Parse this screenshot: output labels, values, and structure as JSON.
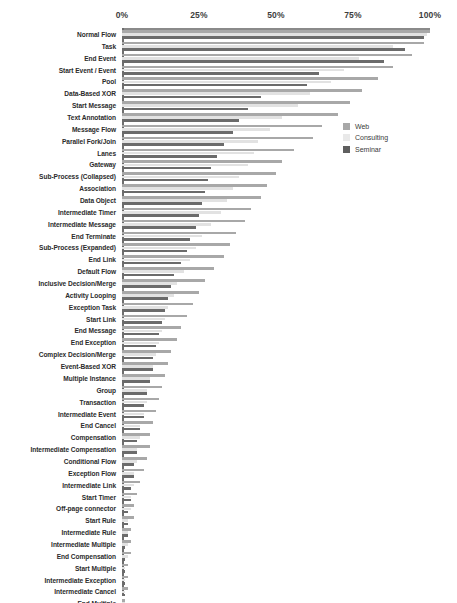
{
  "chart_data": {
    "type": "bar",
    "orientation": "horizontal",
    "title": "",
    "xlabel": "",
    "ylabel": "",
    "xlim": [
      0,
      100
    ],
    "xticks": [
      0,
      25,
      50,
      75,
      100
    ],
    "xtick_labels": [
      "0%",
      "25%",
      "50%",
      "75%",
      "100%"
    ],
    "grid": false,
    "legend_position": "center-right",
    "legend": [
      "Web",
      "Consulting",
      "Seminar"
    ],
    "series_colors": {
      "Web": "#a8a8a8",
      "Consulting": "#e2e2e2",
      "Seminar": "#6b6b6b"
    },
    "categories": [
      "Normal Flow",
      "Task",
      "End Event",
      "Start Event / Event",
      "Pool",
      "Data-Based XOR",
      "Start Message",
      "Text Annotation",
      "Message Flow",
      "Parallel Fork/Join",
      "Lanes",
      "Gateway",
      "Sub-Process (Collapsed)",
      "Association",
      "Data Object",
      "Intermediate Timer",
      "Intermediate Message",
      "End Terminate",
      "Sub-Process (Expanded)",
      "End Link",
      "Default Flow",
      "Inclusive Decision/Merge",
      "Activity Looping",
      "Exception Task",
      "Start Link",
      "End Message",
      "End Exception",
      "Complex Decision/Merge",
      "Event-Based XOR",
      "Multiple Instance",
      "Group",
      "Transaction",
      "Intermediate Event",
      "End Cancel",
      "Compensation",
      "Intermediate Compensation",
      "Conditional Flow",
      "Exception Flow",
      "Intermediate Link",
      "Start Timer",
      "Off-page connector",
      "Start Rule",
      "Intermediate Rule",
      "Intermediate Multiple",
      "End Compensation",
      "Start Multiple",
      "Intermediate Exception",
      "Intermediate Cancel",
      "End Multiple",
      "Compensation Association"
    ],
    "series": [
      {
        "name": "Web",
        "values": [
          100,
          98,
          94,
          88,
          83,
          78,
          74,
          70,
          65,
          62,
          56,
          52,
          50,
          47,
          45,
          42,
          40,
          37,
          35,
          33,
          30,
          27,
          25,
          23,
          21,
          19,
          18,
          16,
          15,
          14,
          13,
          12,
          11,
          10,
          9,
          9,
          8,
          7,
          6,
          5,
          4,
          4,
          3,
          3,
          3,
          2,
          2,
          2,
          1,
          1
        ]
      },
      {
        "name": "Consulting",
        "values": [
          99,
          88,
          77,
          72,
          68,
          61,
          57,
          52,
          48,
          44,
          43,
          41,
          38,
          36,
          34,
          32,
          29,
          26,
          24,
          22,
          20,
          18,
          17,
          15,
          14,
          13,
          12,
          11,
          10,
          9,
          8,
          8,
          7,
          6,
          6,
          5,
          5,
          4,
          4,
          3,
          3,
          2,
          2,
          2,
          2,
          1,
          1,
          1,
          1,
          1
        ]
      },
      {
        "name": "Seminar",
        "values": [
          98,
          92,
          85,
          64,
          60,
          45,
          41,
          38,
          36,
          33,
          31,
          29,
          28,
          27,
          26,
          25,
          24,
          22,
          21,
          19,
          17,
          16,
          15,
          14,
          13,
          12,
          11,
          10,
          10,
          9,
          8,
          7,
          7,
          6,
          5,
          5,
          4,
          4,
          3,
          3,
          2,
          2,
          2,
          1,
          1,
          1,
          1,
          1,
          1,
          1
        ]
      }
    ]
  }
}
